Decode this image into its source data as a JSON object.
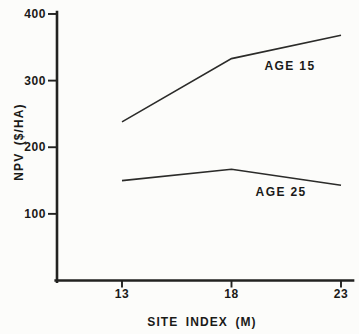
{
  "figure": {
    "background": "#fcfcfa",
    "ink_color": "#222220"
  },
  "chart_data": {
    "type": "line",
    "x": [
      13,
      18,
      23
    ],
    "x_tick_labels": [
      "13",
      "18",
      "23"
    ],
    "series": [
      {
        "name": "AGE 15",
        "values": [
          238,
          333,
          368
        ]
      },
      {
        "name": "AGE 25",
        "values": [
          150,
          167,
          143
        ]
      }
    ],
    "title": "",
    "xlabel": "SITE INDEX (M)",
    "ylabel": "NPV ($/HA)",
    "xlim": [
      10,
      23.55
    ],
    "ylim": [
      0,
      403
    ],
    "yticks": [
      100,
      200,
      300,
      400
    ],
    "ytick_labels": [
      "100",
      "200",
      "300",
      "400"
    ],
    "grid": false,
    "legend": "inline labels next to each line",
    "annotations": [
      {
        "text": "AGE 15",
        "x": 19.5,
        "y": 316,
        "anchor": "start"
      },
      {
        "text": "AGE 25",
        "x": 19.1,
        "y": 127,
        "anchor": "start"
      }
    ]
  }
}
